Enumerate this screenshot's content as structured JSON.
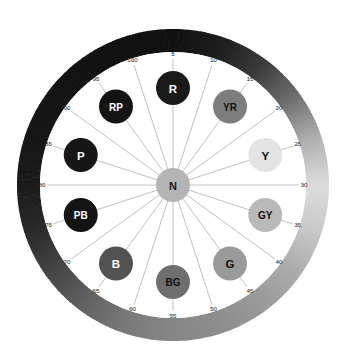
{
  "figure": {
    "name": "munsell-hue-circle",
    "center_label": "N",
    "center_title": "Neutral",
    "background_color": "#ffffff",
    "spoke_color": "#8c8c8c",
    "inner_disc_color": "#ffffff",
    "center_node": {
      "fill": "#b4b4b4",
      "text_color": "#1a1a1a",
      "radius": 17
    },
    "geometry": {
      "cx": 173,
      "cy": 185,
      "ring_outer_radius": 156,
      "ring_inner_radius": 133,
      "spoke_radius": 126,
      "hue_node_radius_from_center": 97,
      "hue_node_size": 17,
      "tick_label_radius": 131
    }
  },
  "chart_data": {
    "type": "pie",
    "subtitle": "",
    "xlabel": "",
    "ylabel": "",
    "legend_position": "none",
    "grid": false,
    "angle_units": "munsell hue 0-100, 5 units per spoke, hue 5 at top, increasing clockwise",
    "tick_values": [
      5,
      10,
      15,
      20,
      25,
      30,
      35,
      40,
      45,
      50,
      55,
      60,
      65,
      70,
      75,
      80,
      85,
      90,
      95,
      100
    ],
    "categories": [
      "R",
      "YR",
      "Y",
      "GY",
      "G",
      "BG",
      "B",
      "PB",
      "P",
      "RP"
    ],
    "values": [
      5,
      15,
      25,
      35,
      45,
      55,
      65,
      75,
      85,
      95
    ],
    "hues": [
      {
        "code": "R",
        "name": "Red",
        "hue": 5,
        "fill": "#1a1a1a",
        "text_color": "#ffffff"
      },
      {
        "code": "YR",
        "name": "Yellow-Red",
        "hue": 15,
        "fill": "#7d7d7d",
        "text_color": "#111111"
      },
      {
        "code": "Y",
        "name": "Yellow",
        "hue": 25,
        "fill": "#e3e3e3",
        "text_color": "#111111"
      },
      {
        "code": "GY",
        "name": "Green-Yellow",
        "hue": 35,
        "fill": "#b9b9b9",
        "text_color": "#111111"
      },
      {
        "code": "G",
        "name": "Green",
        "hue": 45,
        "fill": "#9a9a9a",
        "text_color": "#111111"
      },
      {
        "code": "BG",
        "name": "Blue-Green",
        "hue": 55,
        "fill": "#6e6e6e",
        "text_color": "#111111"
      },
      {
        "code": "B",
        "name": "Blue",
        "hue": 65,
        "fill": "#525252",
        "text_color": "#ffffff"
      },
      {
        "code": "PB",
        "name": "Purple-Blue",
        "hue": 75,
        "fill": "#141414",
        "text_color": "#ffffff"
      },
      {
        "code": "P",
        "name": "Purple",
        "hue": 85,
        "fill": "#161616",
        "text_color": "#ffffff"
      },
      {
        "code": "RP",
        "name": "Red-Purple",
        "hue": 95,
        "fill": "#141414",
        "text_color": "#ffffff"
      }
    ],
    "ring_gradient_stops": [
      {
        "hue": 5,
        "color": "#111111"
      },
      {
        "hue": 10,
        "color": "#1c1c1c"
      },
      {
        "hue": 15,
        "color": "#3a3a3a"
      },
      {
        "hue": 20,
        "color": "#6e6e6e"
      },
      {
        "hue": 25,
        "color": "#b0b0b0"
      },
      {
        "hue": 30,
        "color": "#dcdcdc"
      },
      {
        "hue": 35,
        "color": "#c8c8c8"
      },
      {
        "hue": 40,
        "color": "#aaaaaa"
      },
      {
        "hue": 45,
        "color": "#999999"
      },
      {
        "hue": 50,
        "color": "#8d8d8d"
      },
      {
        "hue": 55,
        "color": "#868686"
      },
      {
        "hue": 60,
        "color": "#7a7a7a"
      },
      {
        "hue": 65,
        "color": "#636363"
      },
      {
        "hue": 70,
        "color": "#454545"
      },
      {
        "hue": 75,
        "color": "#2a2a2a"
      },
      {
        "hue": 80,
        "color": "#1b1b1b"
      },
      {
        "hue": 85,
        "color": "#161616"
      },
      {
        "hue": 90,
        "color": "#141414"
      },
      {
        "hue": 95,
        "color": "#121212"
      },
      {
        "hue": 100,
        "color": "#111111"
      }
    ]
  }
}
